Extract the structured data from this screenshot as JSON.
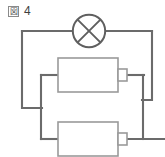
{
  "figure": {
    "label_glyph": "図",
    "label_number": "4",
    "label_full": "図 4"
  },
  "diagram": {
    "background_color": "#ffffff",
    "line_color": "#6b6b6b",
    "component_outline_color": "#8f8f8f",
    "components": [
      {
        "id": "lamp",
        "name": "lamp",
        "symbol": "circle-with-cross",
        "cx": 89,
        "cy": 31,
        "r": 16
      },
      {
        "id": "appliance-1",
        "name": "electric-appliance-upper",
        "symbol": "rectangle-with-terminal",
        "x": 58,
        "y": 58,
        "width": 60,
        "height": 34,
        "terminal": {
          "x": 118,
          "y": 69,
          "width": 9,
          "height": 12
        }
      },
      {
        "id": "appliance-2",
        "name": "electric-appliance-lower",
        "symbol": "rectangle-with-terminal",
        "x": 58,
        "y": 122,
        "width": 60,
        "height": 34,
        "terminal": {
          "x": 118,
          "y": 133,
          "width": 9,
          "height": 12
        }
      }
    ],
    "wires": [
      {
        "id": "top-left-wire",
        "d": "M 22 31 L 73 31"
      },
      {
        "id": "top-right-wire",
        "d": "M 105 31 L 152 31"
      },
      {
        "id": "left-outer-wire",
        "d": "M 22 31 L 22 108 L 41 108"
      },
      {
        "id": "right-outer-wire",
        "d": "M 152 31 L 152 100 L 143 100"
      },
      {
        "id": "left-branch-wire",
        "d": "M 41 75 L 41 139"
      },
      {
        "id": "right-branch-wire",
        "d": "M 143 75 L 143 139"
      },
      {
        "id": "upper-left-lead",
        "d": "M 41 75 L 58 75"
      },
      {
        "id": "upper-right-lead",
        "d": "M 127 75 L 143 75"
      },
      {
        "id": "lower-left-lead",
        "d": "M 41 139 L 58 139"
      },
      {
        "id": "lower-right-lead",
        "d": "M 127 139 L 165 139"
      }
    ]
  }
}
